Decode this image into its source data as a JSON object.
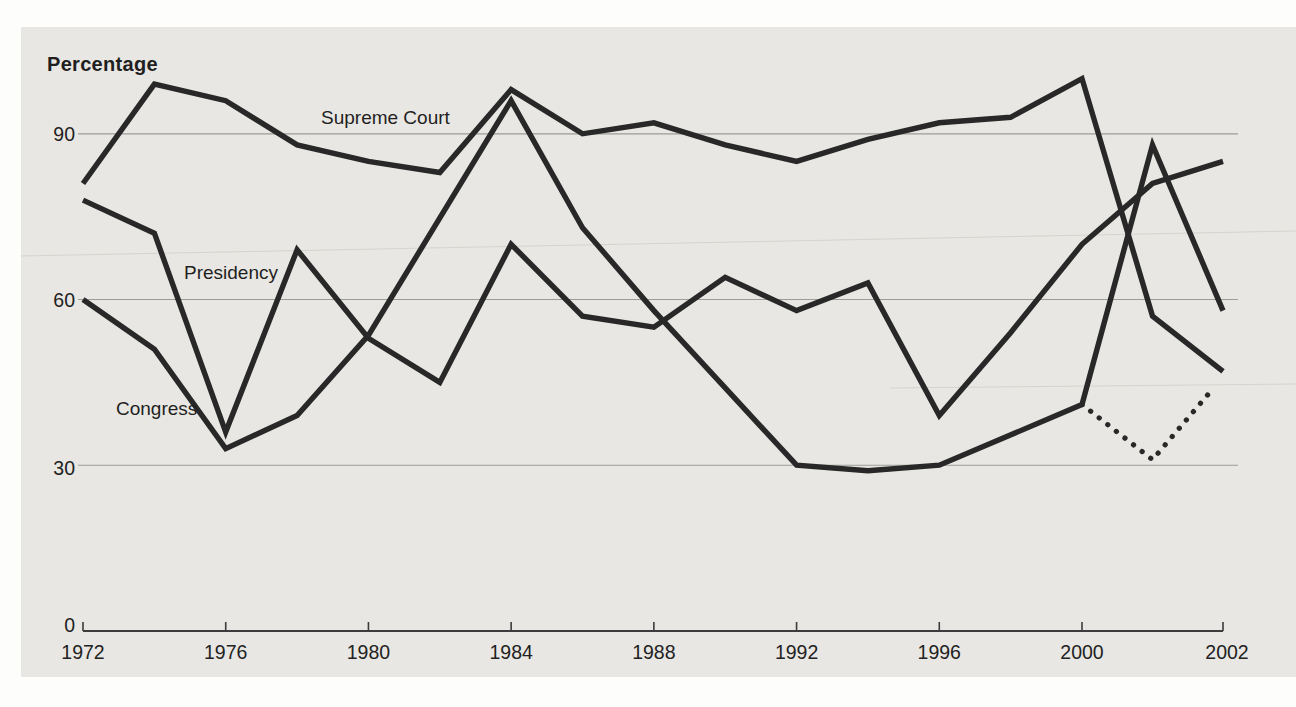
{
  "figure": {
    "kind": "scanned-textbook-line-chart",
    "y_axis_title": "Percentage"
  },
  "chart_data": {
    "type": "line",
    "title": "",
    "ylabel": "Percentage",
    "xlabel": "",
    "ylim": [
      0,
      100
    ],
    "grid": "horizontal",
    "legend_position": "inline-labels",
    "y_ticks": [
      90,
      60,
      30,
      0
    ],
    "x_ticks": [
      1972,
      1976,
      1980,
      1984,
      1988,
      1992,
      1996,
      2000,
      2002
    ],
    "x_axis_note": "final 2000-2002 interval drawn at double width (not to scale)",
    "series": [
      {
        "name": "Supreme Court",
        "style": "solid",
        "points": [
          [
            1972,
            81
          ],
          [
            1974,
            99
          ],
          [
            1976,
            96
          ],
          [
            1978,
            88
          ],
          [
            1980,
            85
          ],
          [
            1982,
            83
          ],
          [
            1984,
            98
          ],
          [
            1986,
            90
          ],
          [
            1988,
            92
          ],
          [
            1990,
            88
          ],
          [
            1992,
            85
          ],
          [
            1994,
            89
          ],
          [
            1996,
            92
          ],
          [
            1998,
            93
          ],
          [
            2000,
            100
          ],
          [
            2001,
            57
          ],
          [
            2002,
            47
          ]
        ]
      },
      {
        "name": "Presidency",
        "style": "solid",
        "points": [
          [
            1972,
            78
          ],
          [
            1974,
            72
          ],
          [
            1976,
            36
          ],
          [
            1978,
            69
          ],
          [
            1980,
            53
          ],
          [
            1982,
            45
          ],
          [
            1984,
            70
          ],
          [
            1986,
            57
          ],
          [
            1988,
            55
          ],
          [
            1990,
            64
          ],
          [
            1992,
            58
          ],
          [
            1994,
            63
          ],
          [
            1996,
            39
          ],
          [
            1998,
            54
          ],
          [
            2000,
            70
          ],
          [
            2001,
            81
          ],
          [
            2002,
            85
          ]
        ]
      },
      {
        "name": "Congress",
        "style": "solid",
        "points": [
          [
            1972,
            60
          ],
          [
            1974,
            51
          ],
          [
            1976,
            33
          ],
          [
            1978,
            39
          ],
          [
            1980,
            53.5
          ],
          [
            1984,
            96
          ],
          [
            1986,
            73
          ],
          [
            1988,
            58
          ],
          [
            1990,
            44
          ],
          [
            1992,
            30
          ],
          [
            1994,
            29
          ],
          [
            1996,
            30
          ],
          [
            2000,
            41
          ],
          [
            2001,
            88
          ],
          [
            2002,
            58
          ]
        ]
      },
      {
        "name": "Congress (dotted branch)",
        "style": "dotted",
        "points": [
          [
            2000,
            41
          ],
          [
            2001,
            31
          ],
          [
            2002,
            46
          ]
        ]
      }
    ]
  },
  "colors": {
    "paper": "#e9e7e3",
    "line": "#282828",
    "grid": "#9b9b97",
    "axis": "#3c3c3c",
    "text": "#222222",
    "scan_artifact": "#d5d3ce"
  },
  "layout_px": {
    "x_of_1972": 83,
    "x_of_2000": 1082,
    "x_of_2002": 1223,
    "y_of_zero": 630.9,
    "px_per_unit": 5.523,
    "grid_x_start": 78,
    "grid_x_end": 1238,
    "axis_y": 631,
    "tick_top": 622,
    "x_label_baseline": 659,
    "y_label_x": 75,
    "y_label_baselines": [
      141,
      307,
      475,
      632
    ]
  }
}
